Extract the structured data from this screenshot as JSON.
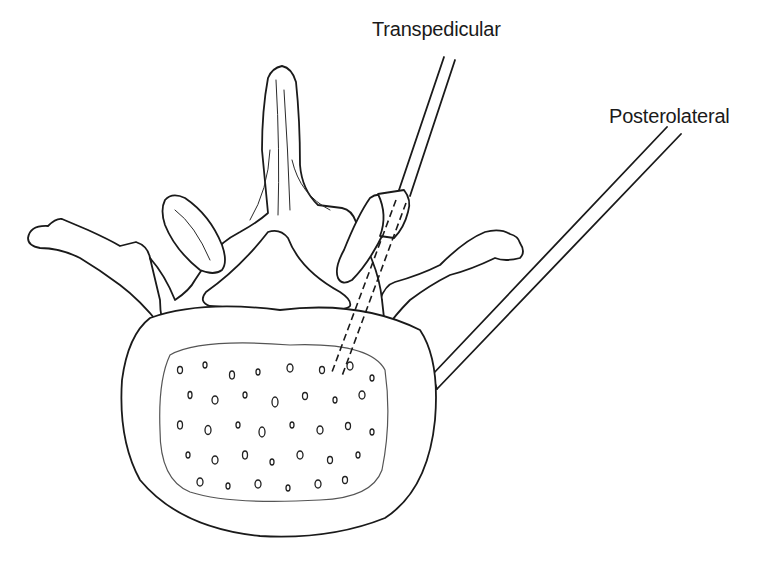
{
  "figure": {
    "labels": {
      "transpedicular": "Transpedicular",
      "posterolateral": "Posterolateral"
    },
    "approaches": [
      {
        "name": "Transpedicular",
        "description": "needle passing through the right pedicle into the vertebral body (dashed path)"
      },
      {
        "name": "Posterolateral",
        "description": "needle approaching the lateral wall of the vertebral body"
      }
    ],
    "structures": [
      "spinous-process",
      "left-transverse-process",
      "right-transverse-process",
      "left-facet",
      "right-facet",
      "spinal-canal",
      "vertebral-body",
      "cancellous-bone"
    ],
    "colors": {
      "line": "#1a1a1a",
      "background": "#ffffff"
    }
  }
}
